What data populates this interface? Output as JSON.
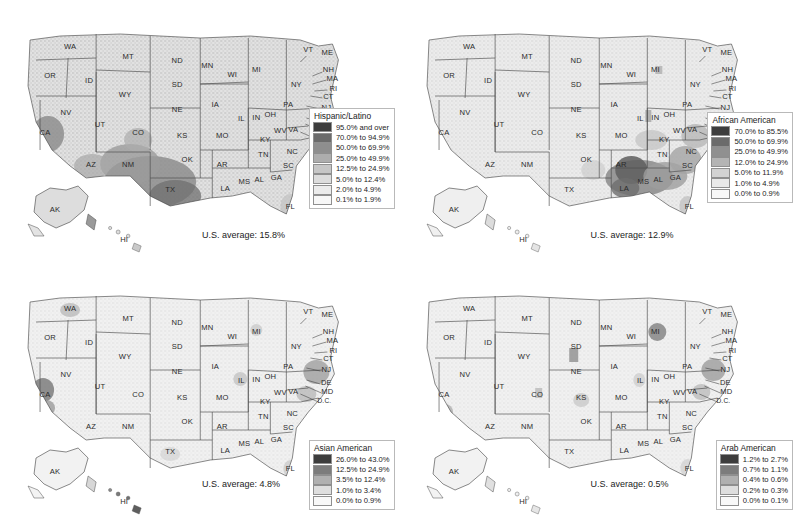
{
  "chart_data": [
    {
      "type": "heatmap",
      "title": "Hispanic/Latino",
      "subtype": "choropleth-county-map",
      "region": "United States",
      "us_average_label": "U.S. average: 15.8%",
      "us_average": 15.8,
      "legend_position": "bottom-right",
      "legend": [
        {
          "label": "95.0% and over",
          "color": "#3d3d3d",
          "min": 95.0,
          "max": 100.0
        },
        {
          "label": "70.0% to 94.9%",
          "color": "#6b6b6b",
          "min": 70.0,
          "max": 94.9
        },
        {
          "label": "50.0% to 69.9%",
          "color": "#8e8e8e",
          "min": 50.0,
          "max": 69.9
        },
        {
          "label": "25.0% to 49.9%",
          "color": "#adadad",
          "min": 25.0,
          "max": 49.9
        },
        {
          "label": "12.5% to 24.9%",
          "color": "#c6c6c6",
          "min": 12.5,
          "max": 24.9
        },
        {
          "label": "5.0% to 12.4%",
          "color": "#dcdcdc",
          "min": 5.0,
          "max": 12.4
        },
        {
          "label": "2.0% to 4.9%",
          "color": "#ebebeb",
          "min": 2.0,
          "max": 4.9
        },
        {
          "label": "0.1% to 1.9%",
          "color": "#f7f7f7",
          "min": 0.1,
          "max": 1.9
        }
      ]
    },
    {
      "type": "heatmap",
      "title": "African American",
      "subtype": "choropleth-county-map",
      "region": "United States",
      "us_average_label": "U.S. average: 12.9%",
      "us_average": 12.9,
      "legend_position": "bottom-right",
      "legend": [
        {
          "label": "70.0% to 85.5%",
          "color": "#3d3d3d",
          "min": 70.0,
          "max": 85.5
        },
        {
          "label": "50.0% to 69.9%",
          "color": "#6b6b6b",
          "min": 50.0,
          "max": 69.9
        },
        {
          "label": "25.0% to 49.9%",
          "color": "#909090",
          "min": 25.0,
          "max": 49.9
        },
        {
          "label": "12.0% to 24.9%",
          "color": "#b4b4b4",
          "min": 12.0,
          "max": 24.9
        },
        {
          "label": "5.0% to 11.9%",
          "color": "#d2d2d2",
          "min": 5.0,
          "max": 11.9
        },
        {
          "label": "1.0% to 4.9%",
          "color": "#e9e9e9",
          "min": 1.0,
          "max": 4.9
        },
        {
          "label": "0.0% to 0.9%",
          "color": "#f8f8f8",
          "min": 0.0,
          "max": 0.9
        }
      ]
    },
    {
      "type": "heatmap",
      "title": "Asian American",
      "subtype": "choropleth-county-map",
      "region": "United States",
      "us_average_label": "U.S. average: 4.8%",
      "us_average": 4.8,
      "legend_position": "bottom-right",
      "legend": [
        {
          "label": "26.0% to 43.0%",
          "color": "#3d3d3d",
          "min": 26.0,
          "max": 43.0
        },
        {
          "label": "12.5% to 24.9%",
          "color": "#7c7c7c",
          "min": 12.5,
          "max": 24.9
        },
        {
          "label": "3.5% to 12.4%",
          "color": "#b0b0b0",
          "min": 3.5,
          "max": 12.4
        },
        {
          "label": "1.0% to 3.4%",
          "color": "#dedede",
          "min": 1.0,
          "max": 3.4
        },
        {
          "label": "0.0% to 0.9%",
          "color": "#f8f8f8",
          "min": 0.0,
          "max": 0.9
        }
      ]
    },
    {
      "type": "heatmap",
      "title": "Arab American",
      "subtype": "choropleth-county-map",
      "region": "United States",
      "us_average_label": "U.S. average: 0.5%",
      "us_average": 0.5,
      "legend_position": "bottom-right",
      "legend": [
        {
          "label": "1.2% to 2.7%",
          "color": "#3d3d3d",
          "min": 1.2,
          "max": 2.7
        },
        {
          "label": "0.7% to 1.1%",
          "color": "#7c7c7c",
          "min": 0.7,
          "max": 1.1
        },
        {
          "label": "0.4% to 0.6%",
          "color": "#b0b0b0",
          "min": 0.4,
          "max": 0.6
        },
        {
          "label": "0.2% to 0.3%",
          "color": "#dedede",
          "min": 0.2,
          "max": 0.3
        },
        {
          "label": "0.0% to 0.1%",
          "color": "#f8f8f8",
          "min": 0.0,
          "max": 0.1
        }
      ]
    }
  ],
  "panels": [
    {
      "id": "hispanic-latino",
      "title": "Hispanic/Latino",
      "average": "U.S. average: 15.8%"
    },
    {
      "id": "african-american",
      "title": "African American",
      "average": "U.S. average: 12.9%"
    },
    {
      "id": "asian-american",
      "title": "Asian American",
      "average": "U.S. average: 4.8%"
    },
    {
      "id": "arab-american",
      "title": "Arab American",
      "average": "U.S. average: 0.5%"
    }
  ],
  "state_labels": [
    {
      "abbr": "WA",
      "x": 70,
      "y": 47
    },
    {
      "abbr": "OR",
      "x": 50,
      "y": 76
    },
    {
      "abbr": "ID",
      "x": 89,
      "y": 81
    },
    {
      "abbr": "MT",
      "x": 128,
      "y": 57
    },
    {
      "abbr": "ND",
      "x": 177,
      "y": 61
    },
    {
      "abbr": "SD",
      "x": 177,
      "y": 85
    },
    {
      "abbr": "WY",
      "x": 125,
      "y": 95
    },
    {
      "abbr": "NV",
      "x": 66,
      "y": 113
    },
    {
      "abbr": "UT",
      "x": 100,
      "y": 125
    },
    {
      "abbr": "CA",
      "x": 45,
      "y": 133
    },
    {
      "abbr": "CO",
      "x": 138,
      "y": 133
    },
    {
      "abbr": "NE",
      "x": 177,
      "y": 110
    },
    {
      "abbr": "KS",
      "x": 182,
      "y": 136
    },
    {
      "abbr": "AZ",
      "x": 91,
      "y": 165
    },
    {
      "abbr": "NM",
      "x": 128,
      "y": 165
    },
    {
      "abbr": "OK",
      "x": 187,
      "y": 160
    },
    {
      "abbr": "TX",
      "x": 170,
      "y": 190
    },
    {
      "abbr": "MN",
      "x": 207,
      "y": 66
    },
    {
      "abbr": "IA",
      "x": 215,
      "y": 105
    },
    {
      "abbr": "MO",
      "x": 222,
      "y": 136
    },
    {
      "abbr": "AR",
      "x": 222,
      "y": 165
    },
    {
      "abbr": "LA",
      "x": 225,
      "y": 189
    },
    {
      "abbr": "WI",
      "x": 232,
      "y": 75
    },
    {
      "abbr": "IL",
      "x": 241,
      "y": 119
    },
    {
      "abbr": "MS",
      "x": 244,
      "y": 182
    },
    {
      "abbr": "MI",
      "x": 256,
      "y": 70
    },
    {
      "abbr": "IN",
      "x": 256,
      "y": 118
    },
    {
      "abbr": "KY",
      "x": 265,
      "y": 140
    },
    {
      "abbr": "TN",
      "x": 263,
      "y": 155
    },
    {
      "abbr": "AL",
      "x": 259,
      "y": 180
    },
    {
      "abbr": "GA",
      "x": 276,
      "y": 178
    },
    {
      "abbr": "OH",
      "x": 270,
      "y": 115
    },
    {
      "abbr": "WV",
      "x": 280,
      "y": 131
    },
    {
      "abbr": "VA",
      "x": 293,
      "y": 130
    },
    {
      "abbr": "PA",
      "x": 288,
      "y": 105
    },
    {
      "abbr": "NY",
      "x": 296,
      "y": 85
    },
    {
      "abbr": "NC",
      "x": 292,
      "y": 152
    },
    {
      "abbr": "SC",
      "x": 288,
      "y": 166
    },
    {
      "abbr": "FL",
      "x": 290,
      "y": 207
    },
    {
      "abbr": "VT",
      "x": 308,
      "y": 50
    },
    {
      "abbr": "ME",
      "x": 327,
      "y": 53
    },
    {
      "abbr": "NH",
      "x": 328,
      "y": 70
    },
    {
      "abbr": "MA",
      "x": 332,
      "y": 79
    },
    {
      "abbr": "RI",
      "x": 333,
      "y": 89
    },
    {
      "abbr": "CT",
      "x": 328,
      "y": 97
    },
    {
      "abbr": "NJ",
      "x": 326,
      "y": 108
    },
    {
      "abbr": "DE",
      "x": 326,
      "y": 121
    },
    {
      "abbr": "MD",
      "x": 327,
      "y": 130
    },
    {
      "abbr": "D.C.",
      "x": 324,
      "y": 139
    },
    {
      "abbr": "AK",
      "x": 55,
      "y": 210
    },
    {
      "abbr": "HI",
      "x": 124,
      "y": 240
    }
  ]
}
